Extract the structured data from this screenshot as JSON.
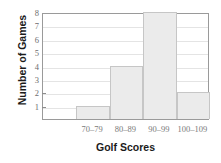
{
  "chart_data": {
    "type": "bar",
    "title": "",
    "subtitle": "",
    "xlabel": "Golf Scores",
    "ylabel": "Number of Games",
    "categories": [
      "70–79",
      "80–89",
      "90–99",
      "100–109"
    ],
    "values": [
      1,
      4,
      8,
      2
    ],
    "series": [
      {
        "name": "Number of Games",
        "values": [
          1,
          4,
          8,
          2
        ]
      }
    ],
    "ylim": [
      0,
      8
    ],
    "yticks": [
      1,
      2,
      3,
      4,
      5,
      6,
      7,
      8
    ],
    "ytick_labels": [
      "1",
      "2",
      "3",
      "4",
      "5",
      "6",
      "7",
      "8"
    ],
    "grid": true,
    "grid_axis": "y",
    "legend": false,
    "legend_position": "none",
    "bar_fill_color": "#ebebeb",
    "bar_border_color": "#c6c6c6",
    "axis_color": "#9a9a9a",
    "grid_color": "#e4e4e4",
    "tick_label_color": "#6e6e6e",
    "title_color": "#1b1b1b",
    "background_color": "#ffffff",
    "annotations": []
  }
}
